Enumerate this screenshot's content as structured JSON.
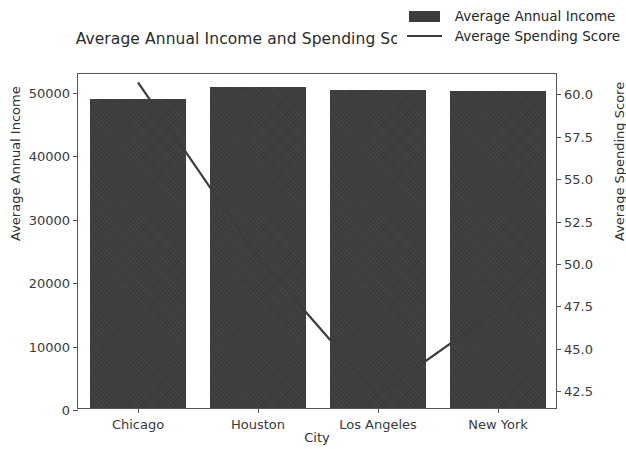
{
  "chart_data": {
    "type": "bar",
    "title": "Average Annual Income and Spending Score by City",
    "xlabel": "City",
    "ylabel": "Average Annual Income",
    "ylabel_secondary": "Average Spending Score",
    "categories": [
      "Chicago",
      "Houston",
      "Los Angeles",
      "New York"
    ],
    "grid": false,
    "legend_position": "upper right",
    "ylim": [
      0,
      53000
    ],
    "ylim_secondary": [
      41.4,
      61.2
    ],
    "yticks": [
      0,
      10000,
      20000,
      30000,
      40000,
      50000
    ],
    "ytick_labels": [
      "0",
      "10000",
      "20000",
      "30000",
      "40000",
      "50000"
    ],
    "yticks_secondary": [
      42.5,
      45.0,
      47.5,
      50.0,
      52.5,
      55.0,
      57.5,
      60.0
    ],
    "ytick_labels_secondary": [
      "42.5",
      "45.0",
      "47.5",
      "50.0",
      "52.5",
      "55.0",
      "57.5",
      "60.0"
    ],
    "series": [
      {
        "name": "Average Annual Income",
        "kind": "bar",
        "axis": "left",
        "color": "#3d3d3d",
        "values": [
          48800,
          50600,
          50200,
          50000
        ]
      },
      {
        "name": "Average Spending Score",
        "kind": "line",
        "axis": "right",
        "color": "#3c3c3c",
        "values": [
          60.7,
          50.4,
          42.3,
          47.3
        ]
      }
    ]
  },
  "legend": {
    "items": [
      {
        "label": "Average Annual Income",
        "marker": "bar-swatch"
      },
      {
        "label": "Average Spending Score",
        "marker": "line-swatch"
      }
    ]
  }
}
